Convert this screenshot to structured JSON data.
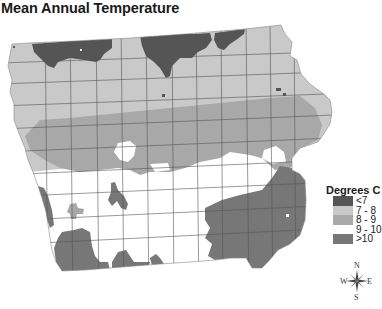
{
  "title": "Mean Annual Temperature",
  "legend": {
    "title": "Degrees C",
    "items": [
      {
        "label": "<7",
        "color": "#555555"
      },
      {
        "label": "7 - 8",
        "color": "#c9c9c9"
      },
      {
        "label": "8 - 9",
        "color": "#a8a8a8"
      },
      {
        "label": "9 - 10",
        "color": "#ffffff"
      },
      {
        "label": ">10",
        "color": "#777777"
      }
    ]
  },
  "compass": {
    "n": "N",
    "s": "S",
    "e": "E",
    "w": "W"
  },
  "map": {
    "region": "Iowa",
    "colors": {
      "lt7": "#555555",
      "c7_8": "#c9c9c9",
      "c8_9": "#a8a8a8",
      "c9_10": "#ffffff",
      "gt10": "#777777",
      "county_line": "#555555"
    }
  }
}
